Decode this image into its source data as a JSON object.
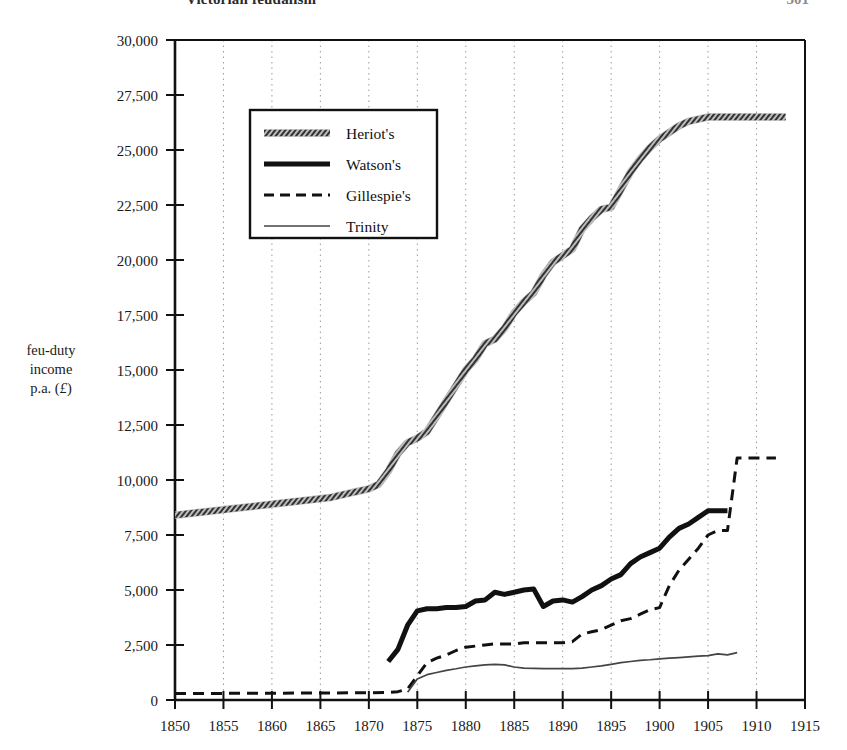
{
  "page": {
    "running_head": "Victorian feudalism",
    "folio": "301"
  },
  "axis": {
    "y_title_line1": "feu-duty",
    "y_title_line2": "income",
    "y_title_line3": "p.a. (",
    "y_title_currency": "£",
    "y_title_close": ")"
  },
  "legend": {
    "items": [
      {
        "label": "Heriot's",
        "style": "hatched-thick"
      },
      {
        "label": "Watson's",
        "style": "solid-thick"
      },
      {
        "label": "Gillespie's",
        "style": "dashed"
      },
      {
        "label": "Trinity",
        "style": "solid-thin"
      }
    ]
  },
  "colors": {
    "ink": "#111111",
    "gridline": "#9a9a9a",
    "axis": "#111111",
    "heriots": "#4a4a4a",
    "watsons": "#111111",
    "gillespies": "#111111",
    "trinity": "#444444"
  },
  "chart_data": {
    "type": "line",
    "title": "",
    "xlabel": "",
    "ylabel": "feu-duty income p.a. (£)",
    "xlim": [
      1850,
      1915
    ],
    "ylim": [
      0,
      30000
    ],
    "xticks": [
      1850,
      1855,
      1860,
      1865,
      1870,
      1875,
      1880,
      1885,
      1890,
      1895,
      1900,
      1905,
      1910,
      1915
    ],
    "yticks": [
      0,
      2500,
      5000,
      7500,
      10000,
      12500,
      15000,
      17500,
      20000,
      22500,
      25000,
      27500,
      30000
    ],
    "ytick_labels": [
      "0",
      "2,500",
      "5,000",
      "7,500",
      "10,000",
      "12,500",
      "15,000",
      "17,500",
      "20,000",
      "22,500",
      "25,000",
      "27,500",
      "30,000"
    ],
    "xtick_labels": [
      "1850",
      "1855",
      "1860",
      "1865",
      "1870",
      "1875",
      "1880",
      "1885",
      "1890",
      "1895",
      "1900",
      "1905",
      "1910",
      "1915"
    ],
    "grid": "vertical-dotted",
    "legend_position": "upper-left-inset",
    "series": [
      {
        "name": "Heriot's",
        "style": "hatched-thick",
        "x": [
          1850,
          1852,
          1854,
          1856,
          1858,
          1860,
          1862,
          1864,
          1866,
          1867,
          1868,
          1869,
          1870,
          1871,
          1872,
          1873,
          1874,
          1875,
          1876,
          1877,
          1878,
          1879,
          1880,
          1881,
          1882,
          1883,
          1884,
          1885,
          1886,
          1887,
          1888,
          1889,
          1890,
          1891,
          1892,
          1893,
          1894,
          1895,
          1896,
          1897,
          1898,
          1899,
          1900,
          1901,
          1902,
          1903,
          1904,
          1905,
          1906,
          1907,
          1908,
          1909,
          1910,
          1911,
          1912,
          1913
        ],
        "y": [
          8400,
          8500,
          8600,
          8700,
          8800,
          8900,
          9000,
          9100,
          9200,
          9300,
          9400,
          9500,
          9600,
          9800,
          10400,
          11200,
          11700,
          11900,
          12200,
          12900,
          13600,
          14300,
          15000,
          15500,
          16200,
          16400,
          16900,
          17600,
          18100,
          18500,
          19300,
          19900,
          20200,
          20500,
          21400,
          21900,
          22300,
          22400,
          23200,
          24000,
          24600,
          25100,
          25500,
          25800,
          26100,
          26300,
          26400,
          26500,
          26500,
          26500,
          26500,
          26500,
          26500,
          26500,
          26500,
          26500
        ]
      },
      {
        "name": "Watson's",
        "style": "solid-thick",
        "x": [
          1872,
          1873,
          1874,
          1875,
          1876,
          1877,
          1878,
          1879,
          1880,
          1881,
          1882,
          1883,
          1884,
          1885,
          1886,
          1887,
          1888,
          1889,
          1890,
          1891,
          1892,
          1893,
          1894,
          1895,
          1896,
          1897,
          1898,
          1899,
          1900,
          1901,
          1902,
          1903,
          1904,
          1905,
          1906,
          1907
        ],
        "y": [
          1750,
          2300,
          3400,
          4050,
          4150,
          4150,
          4200,
          4200,
          4250,
          4500,
          4550,
          4900,
          4800,
          4900,
          5000,
          5050,
          4250,
          4500,
          4550,
          4450,
          4700,
          5000,
          5200,
          5500,
          5700,
          6200,
          6500,
          6700,
          6900,
          7400,
          7800,
          8000,
          8300,
          8600,
          8600,
          8600
        ]
      },
      {
        "name": "Gillespie's",
        "style": "dashed",
        "x": [
          1850,
          1855,
          1860,
          1865,
          1870,
          1872,
          1873,
          1874,
          1875,
          1876,
          1877,
          1878,
          1879,
          1880,
          1881,
          1882,
          1883,
          1884,
          1885,
          1886,
          1887,
          1888,
          1889,
          1890,
          1891,
          1892,
          1893,
          1894,
          1895,
          1896,
          1897,
          1898,
          1899,
          1900,
          1901,
          1902,
          1903,
          1904,
          1905,
          1906,
          1907,
          1908,
          1909,
          1910,
          1911,
          1912
        ],
        "y": [
          300,
          300,
          310,
          320,
          330,
          340,
          380,
          500,
          1100,
          1700,
          1900,
          2050,
          2250,
          2400,
          2450,
          2500,
          2550,
          2550,
          2550,
          2600,
          2600,
          2600,
          2600,
          2600,
          2650,
          3000,
          3100,
          3200,
          3400,
          3600,
          3700,
          3900,
          4100,
          4200,
          5200,
          5900,
          6400,
          6900,
          7500,
          7700,
          7700,
          11000,
          11000,
          11000,
          11000,
          11000
        ]
      },
      {
        "name": "Trinity",
        "style": "solid-thin",
        "x": [
          1874,
          1875,
          1876,
          1877,
          1878,
          1879,
          1880,
          1881,
          1882,
          1883,
          1884,
          1885,
          1886,
          1887,
          1888,
          1889,
          1890,
          1891,
          1892,
          1893,
          1894,
          1895,
          1896,
          1897,
          1898,
          1899,
          1900,
          1901,
          1902,
          1903,
          1904,
          1905,
          1906,
          1907,
          1908
        ],
        "y": [
          350,
          950,
          1150,
          1250,
          1350,
          1420,
          1500,
          1550,
          1600,
          1620,
          1600,
          1500,
          1450,
          1440,
          1430,
          1430,
          1430,
          1430,
          1450,
          1500,
          1550,
          1620,
          1700,
          1750,
          1800,
          1830,
          1870,
          1900,
          1930,
          1960,
          1990,
          2020,
          2100,
          2050,
          2150
        ]
      }
    ]
  }
}
